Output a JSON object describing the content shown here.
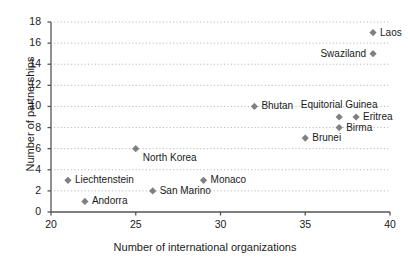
{
  "chart_data": {
    "type": "scatter",
    "title": "",
    "xlabel": "Number of international organizations",
    "ylabel": "Number of partnerships",
    "xlim": [
      20,
      40
    ],
    "ylim": [
      0,
      18
    ],
    "xticks": [
      20,
      25,
      30,
      35,
      40
    ],
    "yticks": [
      0,
      2,
      4,
      6,
      8,
      10,
      12,
      14,
      16,
      18
    ],
    "grid": "horizontal-dotted",
    "legend": "none",
    "marker": "diamond",
    "marker_color": "#808080",
    "axis_color": "#555555",
    "grid_color": "#bbbbbb",
    "text_color": "#1a1a1a",
    "points": [
      {
        "label": "Laos",
        "x": 39,
        "y": 17,
        "label_pos": "right"
      },
      {
        "label": "Swaziland",
        "x": 39,
        "y": 15,
        "label_pos": "left"
      },
      {
        "label": "Equitorial Guinea",
        "x": 37,
        "y": 9,
        "label_pos": "above"
      },
      {
        "label": "Bhutan",
        "x": 32,
        "y": 10,
        "label_pos": "right"
      },
      {
        "label": "Eritrea",
        "x": 38,
        "y": 9,
        "label_pos": "right"
      },
      {
        "label": "Birma",
        "x": 37,
        "y": 8,
        "label_pos": "right"
      },
      {
        "label": "Brunei",
        "x": 35,
        "y": 7,
        "label_pos": "right"
      },
      {
        "label": "North Korea",
        "x": 25,
        "y": 6,
        "label_pos": "below-right"
      },
      {
        "label": "Monaco",
        "x": 29,
        "y": 3,
        "label_pos": "right"
      },
      {
        "label": "Liechtenstein",
        "x": 21,
        "y": 3,
        "label_pos": "right"
      },
      {
        "label": "San Marino",
        "x": 26,
        "y": 2,
        "label_pos": "right"
      },
      {
        "label": "Andorra",
        "x": 22,
        "y": 1,
        "label_pos": "right"
      }
    ]
  }
}
